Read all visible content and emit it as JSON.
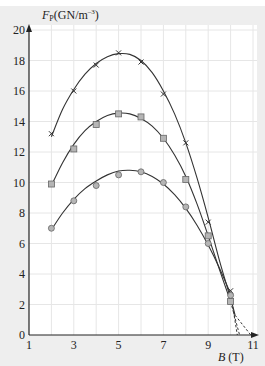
{
  "chart_data": {
    "type": "line",
    "title": "",
    "xlabel": "B (T)",
    "xlabel_var": "B",
    "xlabel_unit": "(T)",
    "ylabel": "F_P (GN/m^-3)",
    "ylabel_var": "F",
    "ylabel_sub": "P",
    "ylabel_unit": "(GN/m",
    "ylabel_sup": "–3",
    "ylabel_close": ")",
    "xlim": [
      1,
      11
    ],
    "ylim": [
      0,
      20
    ],
    "xticks": [
      1,
      3,
      5,
      7,
      9,
      11
    ],
    "yticks": [
      0,
      2,
      4,
      6,
      8,
      10,
      12,
      14,
      16,
      18,
      20
    ],
    "grid": true,
    "legend": null,
    "series": [
      {
        "name": "cross-series",
        "marker": "x",
        "x": [
          2,
          3,
          4,
          5,
          6,
          7,
          8,
          9,
          10
        ],
        "y": [
          13.2,
          16.0,
          17.7,
          18.5,
          17.9,
          15.8,
          12.6,
          7.4,
          2.9
        ],
        "curve": [
          [
            2,
            13.0
          ],
          [
            2.5,
            14.8
          ],
          [
            3,
            16.1
          ],
          [
            3.5,
            17.1
          ],
          [
            4,
            17.8
          ],
          [
            4.5,
            18.25
          ],
          [
            5,
            18.45
          ],
          [
            5.5,
            18.4
          ],
          [
            6,
            18.0
          ],
          [
            6.5,
            17.2
          ],
          [
            7,
            16.0
          ],
          [
            7.5,
            14.5
          ],
          [
            8,
            12.6
          ],
          [
            8.5,
            10.3
          ],
          [
            9,
            7.7
          ],
          [
            9.5,
            4.9
          ],
          [
            10,
            2.4
          ],
          [
            10.2,
            1.3
          ]
        ],
        "extrapolation_zero_B": 10.9
      },
      {
        "name": "square-series",
        "marker": "square",
        "x": [
          2,
          3,
          4,
          5,
          6,
          7,
          8,
          9,
          10
        ],
        "y": [
          9.9,
          12.2,
          13.8,
          14.5,
          14.3,
          12.9,
          10.2,
          6.5,
          2.2
        ],
        "curve": [
          [
            2,
            9.8
          ],
          [
            2.5,
            11.3
          ],
          [
            3,
            12.5
          ],
          [
            3.5,
            13.4
          ],
          [
            4,
            14.0
          ],
          [
            4.5,
            14.4
          ],
          [
            5,
            14.55
          ],
          [
            5.5,
            14.5
          ],
          [
            6,
            14.2
          ],
          [
            6.5,
            13.7
          ],
          [
            7,
            12.9
          ],
          [
            7.5,
            11.8
          ],
          [
            8,
            10.4
          ],
          [
            8.5,
            8.6
          ],
          [
            9,
            6.5
          ],
          [
            9.5,
            4.3
          ],
          [
            10,
            2.2
          ]
        ],
        "extrapolation_zero_B": 10.4
      },
      {
        "name": "circle-series",
        "marker": "circle",
        "x": [
          2,
          3,
          4,
          5,
          6,
          7,
          8,
          9,
          10
        ],
        "y": [
          7.0,
          8.8,
          9.8,
          10.5,
          10.7,
          10.0,
          8.4,
          6.0,
          2.6
        ],
        "curve": [
          [
            2,
            6.9
          ],
          [
            2.5,
            8.0
          ],
          [
            3,
            8.9
          ],
          [
            3.5,
            9.6
          ],
          [
            4,
            10.1
          ],
          [
            4.5,
            10.5
          ],
          [
            5,
            10.75
          ],
          [
            5.5,
            10.8
          ],
          [
            6,
            10.7
          ],
          [
            6.5,
            10.4
          ],
          [
            7,
            9.9
          ],
          [
            7.5,
            9.2
          ],
          [
            8,
            8.3
          ],
          [
            8.5,
            7.2
          ],
          [
            9,
            5.9
          ],
          [
            9.5,
            4.4
          ],
          [
            10,
            2.7
          ]
        ],
        "extrapolation_zero_B": 10.3
      }
    ]
  },
  "colors": {
    "frame_bg": "#eeeeee",
    "plot_bg": "#ffffff",
    "grid": "#e6e6e6",
    "axis": "#222222",
    "line": "#333333",
    "marker_fill": "#b5b5b5"
  }
}
